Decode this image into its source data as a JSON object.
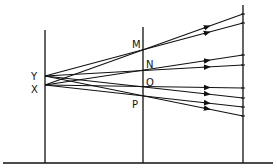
{
  "diagram": {
    "type": "ray diagram: two point sources through slits onto screen",
    "colors": {
      "line": "#111111",
      "background": "#ffffff"
    },
    "baseline": {
      "y": 163,
      "x1": 3,
      "x2": 273
    },
    "screens": [
      {
        "name": "source-plane",
        "x": 45,
        "y_top": 30,
        "y_bottom": 163
      },
      {
        "name": "slit-plane",
        "x": 143,
        "y_top": 27,
        "y_bottom": 163
      },
      {
        "name": "observation-screen",
        "x": 243,
        "y_top": 5,
        "y_bottom": 163
      }
    ],
    "sources": [
      {
        "label": "Y",
        "x": 45,
        "y": 76,
        "label_x": 31,
        "label_y": 80
      },
      {
        "label": "X",
        "x": 45,
        "y": 85,
        "label_x": 31,
        "label_y": 93
      }
    ],
    "slits": [
      {
        "label": "M",
        "y": 50,
        "label_x": 132,
        "label_y": 48
      },
      {
        "label": "N",
        "y": 69,
        "label_x": 146,
        "label_y": 68
      },
      {
        "label": "O",
        "y": 87,
        "label_x": 146,
        "label_y": 86
      },
      {
        "label": "P",
        "y": 97,
        "label_x": 132,
        "label_y": 108
      }
    ],
    "rays": [
      {
        "from": "X",
        "via": "M",
        "end_y": 14
      },
      {
        "from": "Y",
        "via": "M",
        "end_y": 23
      },
      {
        "from": "X",
        "via": "N",
        "end_y": 55
      },
      {
        "from": "Y",
        "via": "N",
        "end_y": 65
      },
      {
        "from": "X",
        "via": "O",
        "end_y": 88
      },
      {
        "from": "Y",
        "via": "O",
        "end_y": 98
      },
      {
        "from": "X",
        "via": "P",
        "end_y": 107
      },
      {
        "from": "Y",
        "via": "P",
        "end_y": 116
      }
    ]
  }
}
